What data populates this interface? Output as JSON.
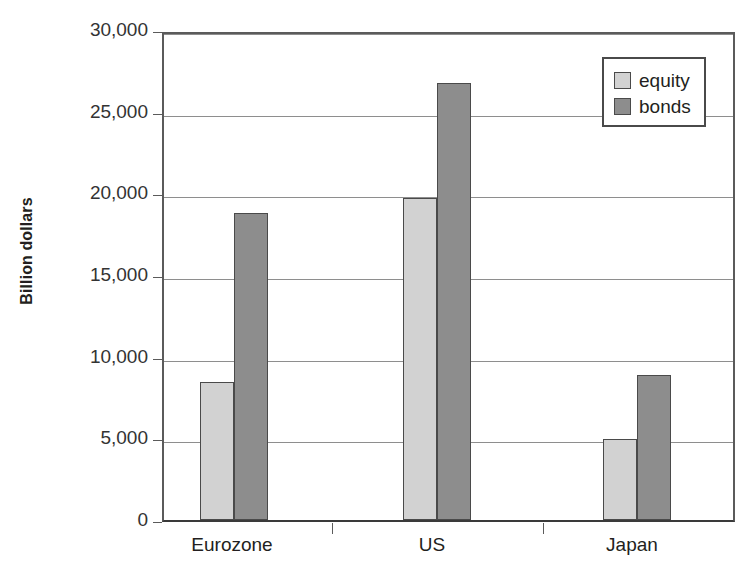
{
  "chart_data": {
    "type": "bar",
    "title": "",
    "xlabel": "",
    "ylabel": "Billion dollars",
    "categories": [
      "Eurozone",
      "US",
      "Japan"
    ],
    "series": [
      {
        "name": "equity",
        "color": "#d2d2d2",
        "values": [
          8450,
          19700,
          4950
        ]
      },
      {
        "name": "bonds",
        "color": "#8d8d8d",
        "values": [
          18800,
          26750,
          8900
        ]
      }
    ],
    "ylim": [
      0,
      30000
    ],
    "yticks": [
      0,
      5000,
      10000,
      15000,
      20000,
      25000,
      30000
    ],
    "ytick_labels": [
      "0",
      "5,000",
      "10,000",
      "15,000",
      "20,000",
      "25,000",
      "30,000"
    ],
    "grid": true,
    "legend_position": "top-right",
    "legend_entries": [
      "equity",
      "bonds"
    ]
  }
}
